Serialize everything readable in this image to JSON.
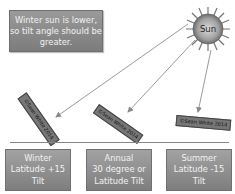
{
  "note": {
    "text": "Winter sun is lower, so tilt angle should be greater."
  },
  "sun": {
    "label": "Sun",
    "color_core": "#bdbdbd",
    "color_rays": "#6f6f6f"
  },
  "panels": [
    {
      "id": "winter",
      "text": "©Sean White 2014",
      "angle_deg": 55
    },
    {
      "id": "annual",
      "text": "©Sean White 2014",
      "angle_deg": 35
    },
    {
      "id": "summer",
      "text": "©Sean White 2014",
      "angle_deg": 5
    }
  ],
  "watermark": "©Sean White 2014",
  "boxes": [
    {
      "id": "winter",
      "line1": "Winter",
      "line2": "Latitude +15",
      "line3": "Tilt"
    },
    {
      "id": "annual",
      "line1": "Annual",
      "line2": "30 degree or",
      "line3": "Latitude Tilt"
    },
    {
      "id": "summer",
      "line1": "Summer",
      "line2": "Latitude -15",
      "line3": "Tilt"
    }
  ]
}
